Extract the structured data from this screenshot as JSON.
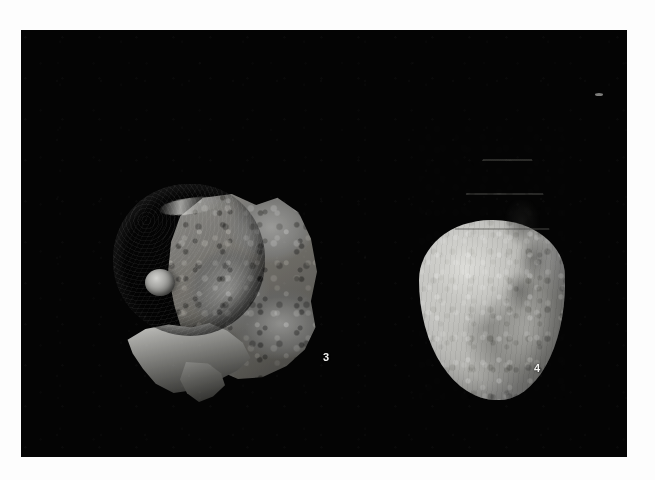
{
  "plate": {
    "kind": "scientific-specimen-plate",
    "medium": "black-and-white photograph",
    "background_color": "#040404",
    "margin_color": "#fdfdfd",
    "subject": "two fossil gastropod shells",
    "photo_field": {
      "x": 21,
      "y": 30,
      "width": 606,
      "height": 427
    }
  },
  "specimens": [
    {
      "label": "3",
      "label_position": {
        "x": 302,
        "y": 322
      },
      "description": "globular dark gastropod shell partly embedded in light rock matrix",
      "tone": "dark gray shell, mid-gray matrix",
      "features": [
        "rounded body whorl with fine concentric growth lines",
        "small pale protoconch knob at left",
        "rough light-gray limestone matrix to the right",
        "pale apertural ledge along the lower margin"
      ],
      "bounds": {
        "x": 86,
        "y": 140,
        "width": 230,
        "height": 235
      },
      "shell_color": "#2e2e2c",
      "matrix_color": "#7d7d7b"
    },
    {
      "label": "4",
      "label_position": {
        "x": 513,
        "y": 333
      },
      "description": "pale conical fusiform gastropod shell, complete, apex upward",
      "tone": "light gray",
      "features": [
        "sharply pointed spire with three to four stepped whorls",
        "large inflated body whorl",
        "mottled and encrusted surface texture on the right flank",
        "rounded base"
      ],
      "bounds": {
        "x": 398,
        "y": 92,
        "width": 146,
        "height": 278
      },
      "shell_color": "#c2c2be"
    }
  ],
  "artifacts": [
    {
      "name": "dust-speck",
      "description": "small white emulsion speck in the upper right of the black field",
      "position": {
        "x": 574,
        "y": 63
      }
    }
  ]
}
